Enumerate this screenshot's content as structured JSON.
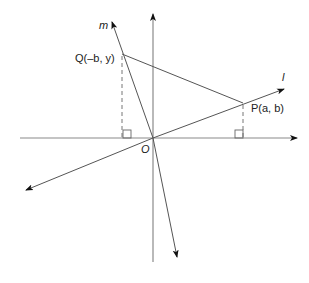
{
  "diagram": {
    "labels": {
      "origin": "O",
      "line_m": "m",
      "line_l": "l",
      "point_q": "Q(–b, y)",
      "point_p": "P(a, b)"
    },
    "colors": {
      "axis": "#8a8a8a",
      "line": "#444444",
      "dashed": "#777777",
      "arrow": "#111111"
    }
  }
}
